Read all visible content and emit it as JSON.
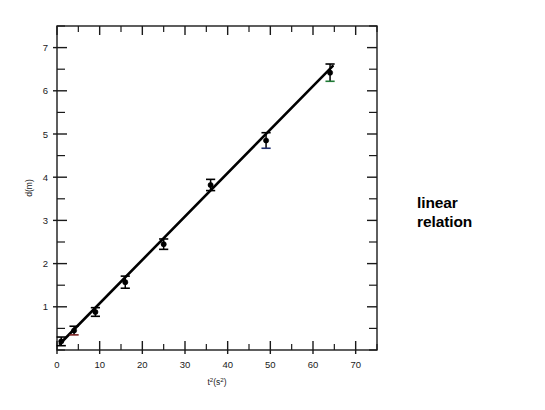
{
  "chart_data": {
    "type": "scatter",
    "title": "",
    "subtitle": "",
    "xlabel": "t²(s²)",
    "xlabel_parts": {
      "base": "t",
      "exp": "2",
      "unit_open": "(s",
      "unit_exp": "2",
      "unit_close": ")"
    },
    "ylabel": "d(m)",
    "xlim": [
      0,
      75
    ],
    "ylim": [
      0,
      7.5
    ],
    "xticks": [
      0,
      10,
      20,
      30,
      40,
      50,
      60,
      70
    ],
    "xticklabels": [
      "0",
      "10",
      "20",
      "30",
      "40",
      "50",
      "60",
      "70"
    ],
    "xminor_step": 5,
    "yticks": [
      1,
      2,
      3,
      4,
      5,
      6,
      7
    ],
    "yticklabels": [
      "1",
      "2",
      "3",
      "4",
      "5",
      "6",
      "7"
    ],
    "yminor_step": 0.5,
    "grid": false,
    "legend": null,
    "legend_position": "none",
    "frame": "box",
    "tick_direction": "in-out",
    "series": [
      {
        "name": "measured distance",
        "marker": "circle",
        "color": "#000000",
        "x": [
          1.0,
          4.0,
          9.0,
          16.0,
          25.0,
          36.0,
          49.0,
          64.0
        ],
        "y": [
          0.2,
          0.45,
          0.88,
          1.57,
          2.45,
          3.82,
          4.85,
          6.42
        ],
        "yerr": [
          0.1,
          0.1,
          0.1,
          0.14,
          0.12,
          0.13,
          0.18,
          0.2
        ],
        "cap_colors": [
          "#000000",
          "#7a2020",
          "#000000",
          "#000000",
          "#000000",
          "#000000",
          "#1f2d6e",
          "#1f7a35"
        ]
      }
    ],
    "fit_line": {
      "name": "linear fit",
      "type": "line",
      "color": "#000000",
      "slope": 0.1005,
      "intercept": 0.075,
      "x_start": 0.7,
      "x_end": 64.6,
      "y_start": 0.145,
      "y_end": 6.57
    },
    "annotations": [
      {
        "id": "linear-relation",
        "lines": [
          "linear",
          "relation"
        ],
        "x_px": 417,
        "y_px": 193,
        "bold": true
      }
    ]
  },
  "annotation": {
    "line1": "linear",
    "line2": "relation"
  },
  "axes": {
    "x_label_base": "t",
    "x_label_exp": "2",
    "x_label_unit_open": "(s",
    "x_label_unit_exp": "2",
    "x_label_unit_close": ")",
    "y_label": "d(m)"
  },
  "xtick_labels": [
    "0",
    "10",
    "20",
    "30",
    "40",
    "50",
    "60",
    "70"
  ],
  "ytick_labels": [
    "1",
    "2",
    "3",
    "4",
    "5",
    "6",
    "7"
  ]
}
